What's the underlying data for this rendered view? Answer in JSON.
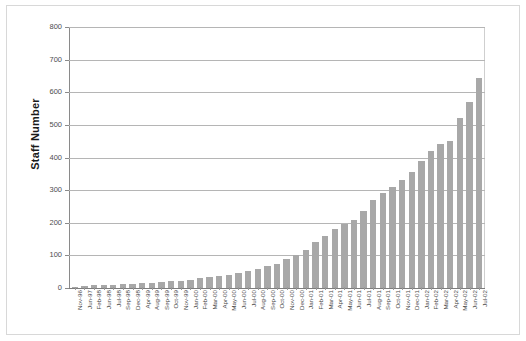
{
  "chart_data": {
    "type": "bar",
    "title": "",
    "xlabel": "",
    "ylabel": "Staff Number",
    "ylim": [
      0,
      800
    ],
    "yticks": [
      0,
      100,
      200,
      300,
      400,
      500,
      600,
      700,
      800
    ],
    "grid": true,
    "legend": "none",
    "bar_color": "#a8a8a8",
    "categories": [
      "Nov-96",
      "Jun-97",
      "Feb-98",
      "Jun-98",
      "Jul-98",
      "Sep-98",
      "Dec-98",
      "Apr-99",
      "Aug-99",
      "Sep-99",
      "Oct-99",
      "Nov-99",
      "Jan-00",
      "Feb-00",
      "Mar-00",
      "Apr-00",
      "May-00",
      "Jun-00",
      "Jul-00",
      "Aug-00",
      "Sep-00",
      "Oct-00",
      "Nov-00",
      "Dec-00",
      "Jan-01",
      "Feb-01",
      "Mar-01",
      "Apr-01",
      "May-01",
      "Jun-01",
      "Jul-01",
      "Aug-01",
      "Sep-01",
      "Oct-01",
      "Nov-01",
      "Dec-01",
      "Jan-02",
      "Feb-02",
      "Mar-02",
      "Apr-02",
      "May-02",
      "Jun-02",
      "Jul-02"
    ],
    "values": [
      3,
      5,
      8,
      9,
      10,
      11,
      12,
      14,
      16,
      18,
      20,
      22,
      26,
      30,
      33,
      36,
      40,
      45,
      52,
      58,
      66,
      74,
      88,
      100,
      118,
      140,
      160,
      180,
      196,
      210,
      235,
      270,
      290,
      310,
      330,
      355,
      390,
      420,
      440,
      450,
      520,
      570,
      645
    ],
    "values_extra": {
      "last_label": "Jul-02",
      "max_value": 690
    }
  },
  "axis": {
    "y_title": "Staff Number"
  }
}
